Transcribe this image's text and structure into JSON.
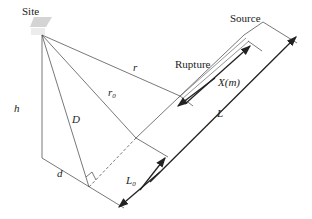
{
  "diagram": {
    "labels": {
      "site": "Site",
      "source": "Source",
      "rupture": "Rupture",
      "r": "r",
      "r0": "r",
      "r0_sub": "0",
      "h": "h",
      "D": "D",
      "d": "d",
      "L": "L",
      "L0": "L",
      "L0_sub": "0",
      "X": "X(m)"
    },
    "colors": {
      "line": "#555555",
      "arrow": "#222222",
      "site_marker": "#cccccc"
    }
  }
}
